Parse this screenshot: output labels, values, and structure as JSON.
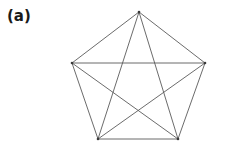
{
  "figure": {
    "panel_label": "(a)",
    "label_color": "#1a1a1a",
    "background_color": "#ffffff",
    "edge_color": "#5a5a5a",
    "vertex_color": "#3a3a3a",
    "edge_width": 0.9
  },
  "chart_data": {
    "type": "diagram",
    "diagram_kind": "graph",
    "title": "(a)",
    "vertex_count": 5,
    "edge_count": 10,
    "vertices": [
      {
        "id": "v1",
        "label": "",
        "x": 139,
        "y": 12
      },
      {
        "id": "v2",
        "label": "",
        "x": 205,
        "y": 63
      },
      {
        "id": "v3",
        "label": "",
        "x": 178,
        "y": 139
      },
      {
        "id": "v4",
        "label": "",
        "x": 98,
        "y": 139
      },
      {
        "id": "v5",
        "label": "",
        "x": 72,
        "y": 63
      }
    ],
    "edges": [
      {
        "from": "v1",
        "to": "v2",
        "kind": "perimeter"
      },
      {
        "from": "v2",
        "to": "v3",
        "kind": "perimeter"
      },
      {
        "from": "v3",
        "to": "v4",
        "kind": "perimeter"
      },
      {
        "from": "v4",
        "to": "v5",
        "kind": "perimeter"
      },
      {
        "from": "v5",
        "to": "v1",
        "kind": "perimeter"
      },
      {
        "from": "v1",
        "to": "v3",
        "kind": "diagonal"
      },
      {
        "from": "v1",
        "to": "v4",
        "kind": "diagonal"
      },
      {
        "from": "v2",
        "to": "v4",
        "kind": "diagonal"
      },
      {
        "from": "v2",
        "to": "v5",
        "kind": "diagonal"
      },
      {
        "from": "v3",
        "to": "v5",
        "kind": "diagonal"
      }
    ]
  }
}
